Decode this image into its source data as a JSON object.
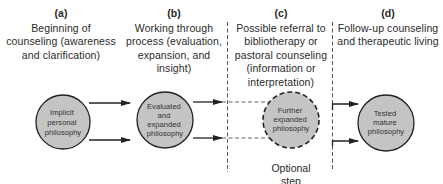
{
  "stages": [
    {
      "letter": "(a)",
      "description": "Beginning of\ncounseling (awareness\nand clarification)",
      "circle_label": [
        "Implicit",
        "personal",
        "philosophy"
      ],
      "circle_style": "solid"
    },
    {
      "letter": "(b)",
      "description": "Working through\nprocess (evaluation,\nexpansion, and\ninsight)",
      "circle_label": [
        "Evaluated",
        "and",
        "expanded",
        "philosophy"
      ],
      "circle_style": "solid"
    },
    {
      "letter": "(c)",
      "description": "Possible referral to\nbibliotherapy or\npastoral counseling\n(information or\ninterpretation)",
      "circle_label": [
        "Further",
        "expanded",
        "philosophy"
      ],
      "circle_style": "dashed",
      "note": "Optional\nstep"
    },
    {
      "letter": "(d)",
      "description": "Follow-up counseling\nand therapeutic living",
      "circle_label": [
        "Tested",
        "mature",
        "philosophy"
      ],
      "circle_style": "solid"
    }
  ],
  "colors": {
    "circle_fill": "#c4c4c4",
    "stroke": "#222222",
    "dashed_line": "#555555"
  }
}
